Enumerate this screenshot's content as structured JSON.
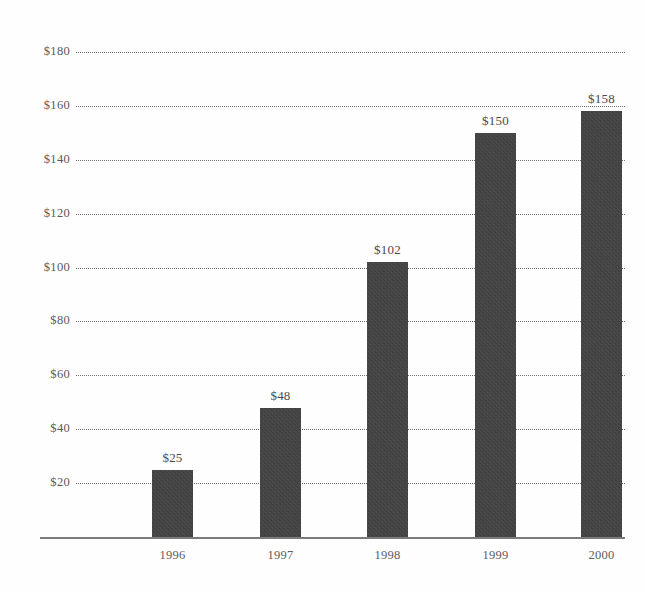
{
  "chart_data": {
    "type": "bar",
    "title": "",
    "title_note": "title is cropped off the top edge of the screenshot",
    "xlabel": "",
    "ylabel": "",
    "categories": [
      "1996",
      "1997",
      "1998",
      "1999",
      "2000"
    ],
    "values": [
      25,
      48,
      102,
      150,
      158
    ],
    "value_labels": [
      "$25",
      "$48",
      "$102",
      "$150",
      "$158"
    ],
    "ylim": [
      0,
      180
    ],
    "y_ticks": [
      20,
      40,
      60,
      80,
      100,
      120,
      140,
      160,
      180
    ],
    "y_tick_labels": [
      "$20",
      "$40",
      "$60",
      "$80",
      "$100",
      "$120",
      "$140",
      "$160",
      "$180"
    ],
    "grid": "horizontal-dotted",
    "legend": "none",
    "bar_color": "#3b3b3b",
    "grid_color": "#6f6f6f",
    "axis_color": "#7b7b7b",
    "background_color": "#fefefe"
  },
  "axes": {
    "y_ticks": [
      {
        "label": "$180",
        "value": 180
      },
      {
        "label": "$160",
        "value": 160
      },
      {
        "label": "$140",
        "value": 140
      },
      {
        "label": "$120",
        "value": 120
      },
      {
        "label": "$100",
        "value": 100
      },
      {
        "label": "$80",
        "value": 80
      },
      {
        "label": "$60",
        "value": 60
      },
      {
        "label": "$40",
        "value": 40
      },
      {
        "label": "$20",
        "value": 20
      }
    ],
    "x_ticks": [
      {
        "label": "1996"
      },
      {
        "label": "1997"
      },
      {
        "label": "1998"
      },
      {
        "label": "1999"
      },
      {
        "label": "2000"
      }
    ]
  },
  "bars": [
    {
      "category": "1996",
      "value": 25,
      "label": "$25"
    },
    {
      "category": "1997",
      "value": 48,
      "label": "$48"
    },
    {
      "category": "1998",
      "value": 102,
      "label": "$102"
    },
    {
      "category": "1999",
      "value": 150,
      "label": "$150"
    },
    {
      "category": "2000",
      "value": 158,
      "label": "$158"
    }
  ],
  "header": {
    "title_fragment": ""
  }
}
